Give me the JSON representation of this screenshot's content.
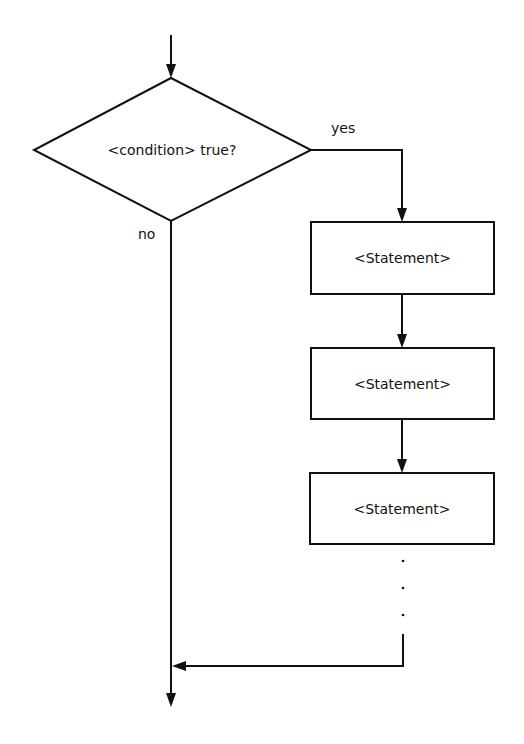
{
  "diagram": {
    "type": "flowchart",
    "decision": {
      "label": "<condition> true?",
      "yes_label": "yes",
      "no_label": "no"
    },
    "statements": [
      {
        "label": "<Statement>"
      },
      {
        "label": "<Statement>"
      },
      {
        "label": "<Statement>"
      }
    ],
    "continuation": "⋮",
    "colors": {
      "stroke": "#111111",
      "background": "#ffffff"
    }
  }
}
